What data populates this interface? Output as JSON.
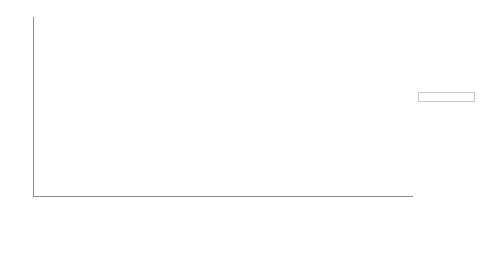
{
  "chart_data": {
    "type": "bar",
    "stacked": true,
    "percent": true,
    "title": "",
    "subtitle": "",
    "xlabel": "",
    "ylabel": "",
    "ylim": [
      0,
      100
    ],
    "yticks": [
      0,
      10,
      20,
      30,
      40,
      50,
      60,
      70,
      80,
      90,
      100
    ],
    "grid": false,
    "legend_position": "right",
    "categories": [
      "Greeting",
      "Introducing",
      "Instructions",
      "Moving on",
      "Vocabulary",
      "Tests",
      "Grammar",
      "Exam techn.",
      "Praising",
      "Correcting",
      "Discipline",
      "Summarising",
      "Ques. (text)",
      "Background",
      "Homework",
      "Personal lang"
    ],
    "series": [
      {
        "name": "German",
        "color": "#b2b2b2",
        "values": [
          75,
          75,
          100,
          100,
          50,
          25,
          0,
          0,
          100,
          100,
          25,
          75,
          75,
          50,
          50,
          100
        ]
      },
      {
        "name": "English",
        "color": "#404040",
        "values": [
          25,
          25,
          0,
          0,
          50,
          75,
          100,
          100,
          0,
          0,
          75,
          25,
          25,
          50,
          50,
          0
        ]
      }
    ]
  },
  "legend": {
    "entries": [
      {
        "label": "German",
        "color": "#b2b2b2"
      },
      {
        "label": "English",
        "color": "#404040"
      }
    ]
  },
  "colors": {
    "german": "#b2b2b2",
    "english": "#404040",
    "axis": "#8a8a8a",
    "text": "#1a1a1a",
    "background": "#ffffff"
  }
}
